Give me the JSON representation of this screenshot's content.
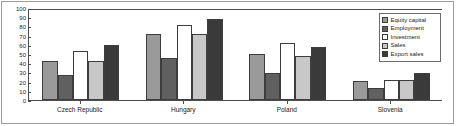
{
  "chart_data": {
    "type": "bar",
    "title": "",
    "xlabel": "",
    "ylabel": "",
    "ylim": [
      0,
      100
    ],
    "yticks": [
      0,
      10,
      20,
      30,
      40,
      50,
      60,
      70,
      80,
      90,
      100
    ],
    "grid": false,
    "legend_position": "upper right",
    "categories": [
      "Czech Republic",
      "Hungary",
      "Poland",
      "Slovenia"
    ],
    "series": [
      {
        "name": "Equity capital",
        "color": "#9a9a9a",
        "values": [
          42,
          72,
          50,
          21
        ]
      },
      {
        "name": "Employment",
        "color": "#606060",
        "values": [
          27,
          46,
          29,
          13
        ]
      },
      {
        "name": "Investment",
        "color": "#ffffff",
        "values": [
          53,
          81,
          62,
          22
        ]
      },
      {
        "name": "Sales",
        "color": "#c8c8c8",
        "values": [
          42,
          72,
          48,
          22
        ]
      },
      {
        "name": "Export sales",
        "color": "#3a3a3a",
        "values": [
          60,
          88,
          58,
          29
        ]
      }
    ]
  },
  "axis": {
    "y_tick_labels": [
      "100",
      "90",
      "80",
      "70",
      "60",
      "50",
      "40",
      "30",
      "20",
      "10",
      "0"
    ]
  },
  "legend": {
    "items": [
      {
        "label": "Equity capital"
      },
      {
        "label": "Employment"
      },
      {
        "label": "Investment"
      },
      {
        "label": "Sales"
      },
      {
        "label": "Export sales"
      }
    ]
  }
}
